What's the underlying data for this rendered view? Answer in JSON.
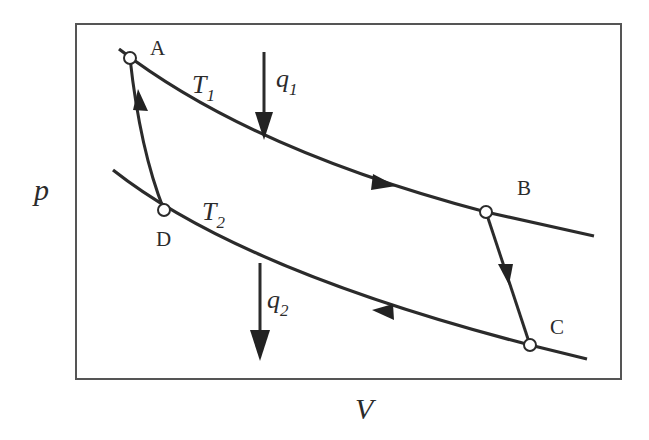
{
  "diagram": {
    "axes": {
      "y_label": "p",
      "x_label": "V"
    },
    "isotherms": [
      {
        "id": "T1",
        "symbol": "T",
        "subscript": "1"
      },
      {
        "id": "T2",
        "symbol": "T",
        "subscript": "2"
      }
    ],
    "states": [
      {
        "id": "A",
        "label": "A"
      },
      {
        "id": "B",
        "label": "B"
      },
      {
        "id": "C",
        "label": "C"
      },
      {
        "id": "D",
        "label": "D"
      }
    ],
    "processes": [
      {
        "from": "A",
        "to": "B",
        "type": "isothermal expansion at T1"
      },
      {
        "from": "B",
        "to": "C",
        "type": "adiabatic expansion"
      },
      {
        "from": "C",
        "to": "D",
        "type": "isothermal compression at T2"
      },
      {
        "from": "D",
        "to": "A",
        "type": "adiabatic compression"
      }
    ],
    "heat_flows": [
      {
        "id": "q1",
        "symbol": "q",
        "subscript": "1",
        "direction": "in"
      },
      {
        "id": "q2",
        "symbol": "q",
        "subscript": "2",
        "direction": "out"
      }
    ],
    "colors": {
      "line": "#2b2b2b",
      "frame": "#555555",
      "background": "#ffffff"
    }
  }
}
